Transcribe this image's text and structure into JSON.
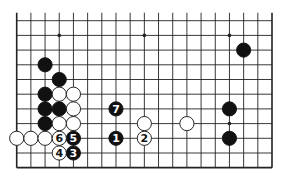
{
  "diagram": {
    "type": "go-board-partial",
    "columns": 19,
    "rows_shown": 11,
    "top_edge_open": true,
    "colors": {
      "black": "#111111",
      "white": "#ffffff",
      "line": "#222222",
      "background": "#ffffff"
    },
    "star_points": [
      {
        "col": 3,
        "row": 1
      },
      {
        "col": 9,
        "row": 1
      },
      {
        "col": 15,
        "row": 1
      },
      {
        "col": 15,
        "row": 7
      }
    ],
    "stones": [
      {
        "color": "black",
        "col": 2,
        "row": 3
      },
      {
        "color": "black",
        "col": 3,
        "row": 4
      },
      {
        "color": "black",
        "col": 2,
        "row": 5
      },
      {
        "color": "white",
        "col": 3,
        "row": 5
      },
      {
        "color": "white",
        "col": 4,
        "row": 5
      },
      {
        "color": "black",
        "col": 2,
        "row": 6
      },
      {
        "color": "black",
        "col": 3,
        "row": 6
      },
      {
        "color": "white",
        "col": 4,
        "row": 6
      },
      {
        "color": "black",
        "col": 2,
        "row": 7
      },
      {
        "color": "white",
        "col": 3,
        "row": 7
      },
      {
        "color": "white",
        "col": 4,
        "row": 7
      },
      {
        "color": "white",
        "col": 0,
        "row": 8
      },
      {
        "color": "white",
        "col": 1,
        "row": 8
      },
      {
        "color": "white",
        "col": 2,
        "row": 8
      },
      {
        "color": "black",
        "col": 16,
        "row": 2
      },
      {
        "color": "white",
        "col": 9,
        "row": 7
      },
      {
        "color": "white",
        "col": 12,
        "row": 7
      },
      {
        "color": "black",
        "col": 15,
        "row": 6
      },
      {
        "color": "black",
        "col": 15,
        "row": 8
      }
    ],
    "moves": [
      {
        "number": "1",
        "color": "black",
        "col": 7,
        "row": 8
      },
      {
        "number": "2",
        "color": "white",
        "col": 9,
        "row": 8
      },
      {
        "number": "3",
        "color": "black",
        "col": 4,
        "row": 9
      },
      {
        "number": "4",
        "color": "white",
        "col": 3,
        "row": 9
      },
      {
        "number": "5",
        "color": "black",
        "col": 4,
        "row": 8
      },
      {
        "number": "6",
        "color": "white",
        "col": 3,
        "row": 8
      },
      {
        "number": "7",
        "color": "black",
        "col": 7,
        "row": 6
      }
    ]
  }
}
